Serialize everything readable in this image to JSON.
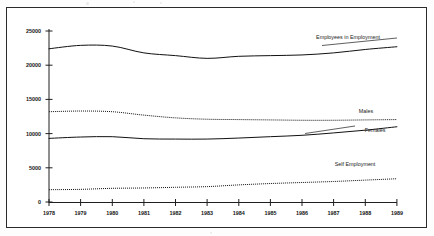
{
  "chart_data": {
    "type": "line",
    "title": "",
    "subtitle": "",
    "xlabel": "",
    "ylabel": "",
    "categories": [
      "1978",
      "1979",
      "1980",
      "1981",
      "1982",
      "1983",
      "1984",
      "1985",
      "1986",
      "1987",
      "1988",
      "1989"
    ],
    "x": [
      1978,
      1979,
      1980,
      1981,
      1982,
      1983,
      1984,
      1985,
      1986,
      1987,
      1988,
      1989
    ],
    "xlim": [
      1978,
      1989
    ],
    "ylim": [
      0,
      25000
    ],
    "y_ticks": [
      0,
      5000,
      10000,
      15000,
      20000,
      25000
    ],
    "y_tick_labels": [
      "0",
      "5000",
      "10000",
      "15000",
      "20000",
      "25000"
    ],
    "x_ticks": [
      1978,
      1979,
      1980,
      1981,
      1982,
      1983,
      1984,
      1985,
      1986,
      1987,
      1988,
      1989
    ],
    "x_tick_labels": [
      "1978",
      "1979",
      "1980",
      "1981",
      "1982",
      "1983",
      "1984",
      "1985",
      "1986",
      "1987",
      "1988",
      "1989"
    ],
    "grid": false,
    "legend_position": "inline-annotations",
    "series": [
      {
        "name": "Employees in Employment",
        "style": "solid",
        "color": "#111111",
        "values": [
          22400,
          22900,
          22800,
          21800,
          21400,
          21000,
          21300,
          21400,
          21500,
          21800,
          22300,
          22700
        ]
      },
      {
        "name": "Males",
        "style": "dotted",
        "color": "#111111",
        "values": [
          13200,
          13300,
          13200,
          12700,
          12300,
          12100,
          12050,
          12000,
          11950,
          11950,
          12000,
          12050
        ]
      },
      {
        "name": "Females",
        "style": "solid",
        "color": "#111111",
        "values": [
          9300,
          9500,
          9550,
          9250,
          9200,
          9200,
          9350,
          9550,
          9750,
          10100,
          10500,
          11000
        ]
      },
      {
        "name": "Self Employment",
        "style": "dotted",
        "color": "#111111",
        "values": [
          1800,
          1850,
          2000,
          2050,
          2150,
          2250,
          2500,
          2700,
          2850,
          3000,
          3200,
          3400
        ]
      }
    ],
    "annotations": [
      {
        "text": "Employees in Employment",
        "series": "Employees in Employment"
      },
      {
        "text": "Males",
        "series": "Males"
      },
      {
        "text": "Females",
        "series": "Females"
      },
      {
        "text": "Self Employment",
        "series": "Self Employment"
      }
    ]
  },
  "figure": {
    "background_color": "#ffffff",
    "border_color": "#2b2b2b",
    "axis_color": "#1f1f1f"
  }
}
